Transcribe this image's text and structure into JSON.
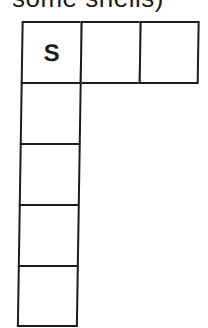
{
  "caption": {
    "text": "some shells)"
  },
  "grid": {
    "cells": [
      {
        "id": "r0c0",
        "row": 0,
        "col": 0,
        "label": "S"
      },
      {
        "id": "r0c1",
        "row": 0,
        "col": 1,
        "label": ""
      },
      {
        "id": "r0c2",
        "row": 0,
        "col": 2,
        "label": ""
      },
      {
        "id": "r1c0",
        "row": 1,
        "col": 0,
        "label": ""
      },
      {
        "id": "r2c0",
        "row": 2,
        "col": 0,
        "label": ""
      },
      {
        "id": "r3c0",
        "row": 3,
        "col": 0,
        "label": ""
      },
      {
        "id": "r4c0",
        "row": 4,
        "col": 0,
        "label": ""
      }
    ]
  },
  "colors": {
    "line": "#1c1c1c",
    "background": "#ffffff"
  }
}
